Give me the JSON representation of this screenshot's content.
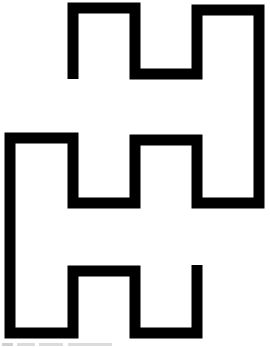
{
  "figure": {
    "stroke_color": "#000000",
    "background_color": "#ffffff",
    "stroke_width": 11,
    "points": [
      [
        73,
        79
      ],
      [
        73,
        8
      ],
      [
        135,
        8
      ],
      [
        135,
        74
      ],
      [
        197,
        74
      ],
      [
        197,
        10
      ],
      [
        259,
        10
      ],
      [
        259,
        203
      ],
      [
        197,
        203
      ],
      [
        197,
        140
      ],
      [
        135,
        140
      ],
      [
        135,
        203
      ],
      [
        73,
        203
      ],
      [
        73,
        138
      ],
      [
        10,
        138
      ],
      [
        10,
        333
      ],
      [
        73,
        333
      ],
      [
        73,
        271
      ],
      [
        135,
        271
      ],
      [
        135,
        333
      ],
      [
        197,
        333
      ],
      [
        197,
        265
      ]
    ]
  },
  "caption_fragment": {
    "visible": true,
    "text": ""
  }
}
